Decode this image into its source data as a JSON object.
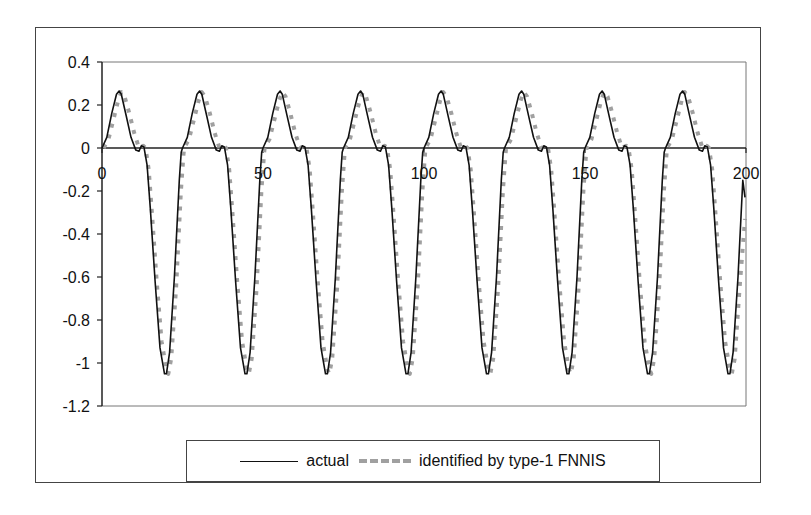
{
  "chart_data": {
    "type": "line",
    "title": "",
    "xlabel": "",
    "ylabel": "",
    "xlim": [
      0,
      200
    ],
    "ylim": [
      -1.2,
      0.4
    ],
    "x_ticks": [
      0,
      50,
      100,
      150,
      200
    ],
    "x_tick_labels": [
      "0",
      "50",
      "100",
      "150",
      "200"
    ],
    "y_ticks": [
      0.4,
      0.2,
      0,
      -0.2,
      -0.4,
      -0.6,
      -0.8,
      -1,
      -1.2
    ],
    "y_tick_labels": [
      "0.4",
      "0.2",
      "0",
      "-0.2",
      "-0.4",
      "-0.6",
      "-0.8",
      "-1",
      "-1.2"
    ],
    "grid": false,
    "x_axis_crosses_at_y": 0,
    "legend_position": "bottom",
    "period": 25,
    "cycles": 8,
    "series": [
      {
        "name": "actual",
        "style": "solid",
        "color": "#111111",
        "cycle_x": [
          0,
          1.5,
          3,
          4.5,
          5.3,
          6,
          7.5,
          9,
          10.5,
          11.5,
          12.2,
          13,
          14,
          15,
          16.5,
          18,
          19.4,
          20,
          21,
          22.5,
          24,
          24.6,
          25
        ],
        "cycle_y": [
          0,
          0.05,
          0.16,
          0.25,
          0.265,
          0.25,
          0.15,
          0.05,
          -0.01,
          -0.015,
          0.01,
          0.005,
          -0.08,
          -0.28,
          -0.62,
          -0.93,
          -1.05,
          -1.05,
          -0.95,
          -0.6,
          -0.15,
          -0.02,
          0
        ],
        "end_x": 200,
        "end_y": -0.23
      },
      {
        "name": "identified by type-1 FNNIS",
        "style": "dashed",
        "color": "#a0a0a0",
        "cycle_x": [
          0.5,
          2,
          3.5,
          5,
          6,
          7,
          8.5,
          10,
          11.5,
          12.8,
          13.5,
          14.5,
          15.5,
          17,
          18.5,
          20,
          20.6,
          21.5,
          23,
          24.5,
          25.3,
          25.5
        ],
        "cycle_y": [
          0,
          0.04,
          0.13,
          0.22,
          0.26,
          0.24,
          0.16,
          0.07,
          0.0,
          0.01,
          0.0,
          -0.1,
          -0.3,
          -0.62,
          -0.9,
          -1.03,
          -1.05,
          -0.98,
          -0.65,
          -0.2,
          -0.03,
          0
        ],
        "end_x": 200,
        "end_y": -0.33
      }
    ]
  },
  "legend": {
    "entries": [
      {
        "label": "actual"
      },
      {
        "label": "identified by type-1 FNNIS"
      }
    ]
  }
}
